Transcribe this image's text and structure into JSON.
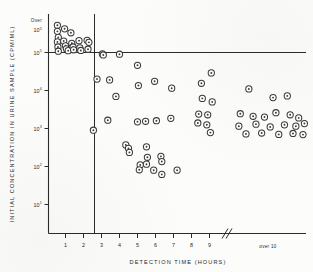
{
  "figure": {
    "kind": "scatter-plot",
    "marker_style": "open-circle-with-center-dot"
  },
  "chart_data": {
    "type": "scatter",
    "title": "",
    "xlabel": "DETECTION TIME (HOURS)",
    "ylabel": "INITIAL CONCENTRATION IN URINE SAMPLE (CPM/ML)",
    "x_tick_labels": [
      "1",
      "2",
      "3",
      "4",
      "5",
      "6",
      "7",
      "8",
      "9"
    ],
    "x_tick_values": [
      1,
      2,
      3,
      4,
      5,
      6,
      7,
      8,
      9
    ],
    "x_overflow_label": "over 10",
    "x_axis_break": true,
    "y_tick_labels": [
      "10¹",
      "10²",
      "10³",
      "10⁴",
      "10⁵"
    ],
    "y_tick_values": [
      10,
      100,
      1000,
      10000,
      100000
    ],
    "y_scale": "log",
    "y_overflow_label": "Over 10⁵",
    "grid": false,
    "legend": "none",
    "reference_lines": [
      {
        "orientation": "vertical",
        "x": 2.5
      },
      {
        "orientation": "horizontal",
        "y": 100000
      }
    ],
    "series": [
      {
        "name": "urine samples",
        "points": [
          {
            "x": 0.55,
            "y": 520000
          },
          {
            "x": 0.55,
            "y": 360000
          },
          {
            "x": 0.6,
            "y": 250000
          },
          {
            "x": 0.55,
            "y": 190000
          },
          {
            "x": 0.58,
            "y": 140000
          },
          {
            "x": 0.6,
            "y": 108000
          },
          {
            "x": 0.95,
            "y": 420000
          },
          {
            "x": 0.9,
            "y": 200000
          },
          {
            "x": 1.0,
            "y": 150000
          },
          {
            "x": 1.05,
            "y": 125000
          },
          {
            "x": 1.15,
            "y": 112000
          },
          {
            "x": 1.3,
            "y": 330000
          },
          {
            "x": 1.35,
            "y": 175000
          },
          {
            "x": 1.42,
            "y": 140000
          },
          {
            "x": 1.45,
            "y": 118000
          },
          {
            "x": 1.75,
            "y": 205000
          },
          {
            "x": 1.8,
            "y": 132000
          },
          {
            "x": 1.85,
            "y": 113000
          },
          {
            "x": 2.2,
            "y": 210000
          },
          {
            "x": 2.3,
            "y": 185000
          },
          {
            "x": 2.25,
            "y": 122000
          },
          {
            "x": 3.05,
            "y": 92000
          },
          {
            "x": 3.1,
            "y": 86000
          },
          {
            "x": 4.0,
            "y": 90000
          },
          {
            "x": 5.0,
            "y": 46000
          },
          {
            "x": 2.75,
            "y": 20000
          },
          {
            "x": 3.45,
            "y": 19000
          },
          {
            "x": 5.05,
            "y": 13500
          },
          {
            "x": 5.95,
            "y": 17500
          },
          {
            "x": 6.9,
            "y": 11500
          },
          {
            "x": 3.8,
            "y": 7000
          },
          {
            "x": 3.35,
            "y": 1650
          },
          {
            "x": 2.55,
            "y": 900
          },
          {
            "x": 5.0,
            "y": 1500
          },
          {
            "x": 5.45,
            "y": 1550
          },
          {
            "x": 6.05,
            "y": 1600
          },
          {
            "x": 6.85,
            "y": 1850
          },
          {
            "x": 4.35,
            "y": 370
          },
          {
            "x": 4.5,
            "y": 300
          },
          {
            "x": 4.55,
            "y": 235
          },
          {
            "x": 5.5,
            "y": 330
          },
          {
            "x": 5.55,
            "y": 175
          },
          {
            "x": 5.5,
            "y": 115
          },
          {
            "x": 5.15,
            "y": 110
          },
          {
            "x": 6.3,
            "y": 185
          },
          {
            "x": 6.35,
            "y": 135
          },
          {
            "x": 5.1,
            "y": 82
          },
          {
            "x": 5.9,
            "y": 80
          },
          {
            "x": 6.35,
            "y": 62
          },
          {
            "x": 7.2,
            "y": 80
          },
          {
            "x": 9.1,
            "y": 29000
          },
          {
            "x": 8.55,
            "y": 15500
          },
          {
            "x": 9.65,
            "y": 11000
          },
          {
            "x": 8.6,
            "y": 6200
          },
          {
            "x": 9.15,
            "y": 5000
          },
          {
            "x": 10.5,
            "y": 6500
          },
          {
            "x": 11.0,
            "y": 7200
          },
          {
            "x": 8.4,
            "y": 2400
          },
          {
            "x": 8.9,
            "y": 2300
          },
          {
            "x": 9.35,
            "y": 2450
          },
          {
            "x": 9.8,
            "y": 2100
          },
          {
            "x": 10.2,
            "y": 2000
          },
          {
            "x": 10.6,
            "y": 2600
          },
          {
            "x": 11.1,
            "y": 2300
          },
          {
            "x": 11.4,
            "y": 1900
          },
          {
            "x": 8.35,
            "y": 1400
          },
          {
            "x": 8.85,
            "y": 1250
          },
          {
            "x": 9.3,
            "y": 1150
          },
          {
            "x": 9.9,
            "y": 1300
          },
          {
            "x": 10.4,
            "y": 1100
          },
          {
            "x": 10.9,
            "y": 1250
          },
          {
            "x": 11.3,
            "y": 1150
          },
          {
            "x": 11.6,
            "y": 1350
          },
          {
            "x": 9.05,
            "y": 780
          },
          {
            "x": 9.55,
            "y": 720
          },
          {
            "x": 10.1,
            "y": 760
          },
          {
            "x": 10.7,
            "y": 700
          },
          {
            "x": 11.2,
            "y": 740
          },
          {
            "x": 11.55,
            "y": 690
          }
        ]
      }
    ]
  }
}
